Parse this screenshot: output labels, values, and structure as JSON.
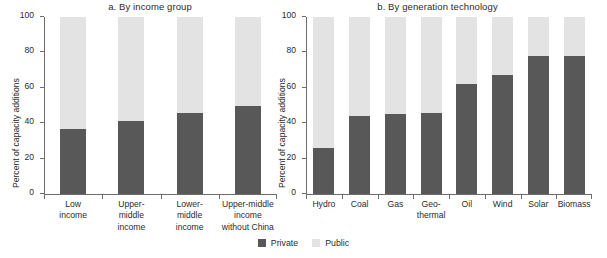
{
  "legend": [
    {
      "label": "Private",
      "color": "#585858"
    },
    {
      "label": "Public",
      "color": "#e3e3e3"
    }
  ],
  "chart_data": [
    {
      "type": "bar",
      "stacked": true,
      "title": "a. By income group",
      "xlabel": "",
      "ylabel": "Percent of capacity additions",
      "ylim": [
        0,
        100
      ],
      "yticks": [
        0,
        20,
        40,
        60,
        80,
        100
      ],
      "ytick_labels": [
        "0",
        "20",
        "40",
        "60",
        "80",
        "100"
      ],
      "grid": false,
      "legend_position": "bottom-center",
      "categories": [
        "Low\nincome",
        "Upper-\nmiddle\nincome",
        "Lower-\nmiddle\nincome",
        "Upper-middle\nincome\nwithout China"
      ],
      "series": [
        {
          "name": "Private",
          "color": "#585858",
          "values": [
            37,
            41,
            46,
            50
          ]
        },
        {
          "name": "Public",
          "color": "#e3e3e3",
          "values": [
            63,
            59,
            54,
            50
          ]
        }
      ]
    },
    {
      "type": "bar",
      "stacked": true,
      "title": "b. By generation technology",
      "xlabel": "",
      "ylabel": "Percent of capacity additions",
      "ylim": [
        0,
        100
      ],
      "yticks": [
        0,
        20,
        40,
        60,
        80,
        100
      ],
      "ytick_labels": [
        "0",
        "20",
        "40",
        "60",
        "80",
        "100"
      ],
      "grid": false,
      "legend_position": "bottom-center",
      "categories": [
        "Hydro",
        "Coal",
        "Gas",
        "Geo-\nthermal",
        "Oil",
        "Wind",
        "Solar",
        "Biomass"
      ],
      "series": [
        {
          "name": "Private",
          "color": "#585858",
          "values": [
            26,
            44,
            45,
            46,
            62,
            67,
            78,
            78
          ]
        },
        {
          "name": "Public",
          "color": "#e3e3e3",
          "values": [
            74,
            56,
            55,
            54,
            38,
            33,
            22,
            22
          ]
        }
      ]
    }
  ]
}
